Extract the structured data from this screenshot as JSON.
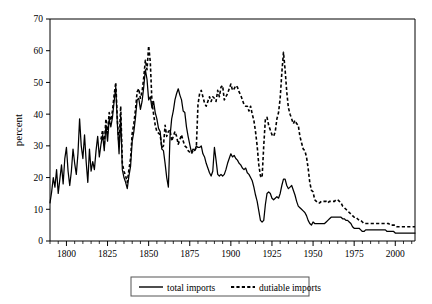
{
  "chart_data": {
    "type": "line",
    "title": "",
    "xlabel": "",
    "ylabel": "percent",
    "xlim": [
      1790,
      2012
    ],
    "ylim": [
      0,
      70
    ],
    "grid": false,
    "legend_position": "bottom-center",
    "y_ticks": [
      0,
      10,
      20,
      30,
      40,
      50,
      60,
      70
    ],
    "y_tick_labels": [
      "0",
      "10",
      "20",
      "30",
      "40",
      "50",
      "60",
      "70"
    ],
    "x_ticks": [
      1800,
      1825,
      1850,
      1875,
      1900,
      1925,
      1950,
      1975,
      2000
    ],
    "x_tick_labels": [
      "1800",
      "1825",
      "1850",
      "1875",
      "1900",
      "1925",
      "1950",
      "1975",
      "2000"
    ],
    "x_minor_tick_step": 5,
    "series": [
      {
        "name": "total imports",
        "style": "solid",
        "color": "#000000",
        "x": [
          1790,
          1791,
          1792,
          1793,
          1794,
          1795,
          1796,
          1797,
          1798,
          1799,
          1800,
          1801,
          1802,
          1803,
          1804,
          1805,
          1806,
          1807,
          1808,
          1809,
          1810,
          1811,
          1812,
          1813,
          1814,
          1815,
          1816,
          1817,
          1818,
          1819,
          1820,
          1821,
          1822,
          1823,
          1824,
          1825,
          1826,
          1827,
          1828,
          1829,
          1830,
          1831,
          1832,
          1833,
          1834,
          1835,
          1836,
          1837,
          1838,
          1839,
          1840,
          1841,
          1842,
          1843,
          1844,
          1845,
          1846,
          1847,
          1848,
          1849,
          1850,
          1851,
          1852,
          1853,
          1854,
          1855,
          1856,
          1857,
          1858,
          1859,
          1860,
          1861,
          1862,
          1863,
          1864,
          1865,
          1866,
          1867,
          1868,
          1869,
          1870,
          1871,
          1872,
          1873,
          1874,
          1875,
          1876,
          1877,
          1878,
          1879,
          1880,
          1881,
          1882,
          1883,
          1884,
          1885,
          1886,
          1887,
          1888,
          1889,
          1890,
          1891,
          1892,
          1893,
          1894,
          1895,
          1896,
          1897,
          1898,
          1899,
          1900,
          1901,
          1902,
          1903,
          1904,
          1905,
          1906,
          1907,
          1908,
          1909,
          1910,
          1911,
          1912,
          1913,
          1914,
          1915,
          1916,
          1917,
          1918,
          1919,
          1920,
          1921,
          1922,
          1923,
          1924,
          1925,
          1926,
          1927,
          1928,
          1929,
          1930,
          1931,
          1932,
          1933,
          1934,
          1935,
          1936,
          1937,
          1938,
          1939,
          1940,
          1941,
          1942,
          1943,
          1944,
          1945,
          1946,
          1947,
          1948,
          1949,
          1950,
          1951,
          1952,
          1953,
          1954,
          1955,
          1956,
          1957,
          1958,
          1959,
          1960,
          1961,
          1962,
          1963,
          1964,
          1965,
          1966,
          1967,
          1968,
          1969,
          1970,
          1971,
          1972,
          1973,
          1974,
          1975,
          1976,
          1977,
          1978,
          1979,
          1980,
          1981,
          1982,
          1983,
          1984,
          1985,
          1986,
          1987,
          1988,
          1989,
          1990,
          1991,
          1992,
          1993,
          1994,
          1995,
          1996,
          1997,
          1998,
          1999,
          2000,
          2001,
          2002,
          2003,
          2004,
          2005,
          2006,
          2007,
          2008,
          2009,
          2010,
          2011,
          2012
        ],
        "y": [
          12.0,
          15.5,
          20.0,
          17.0,
          22.5,
          15.0,
          19.5,
          24.0,
          18.0,
          26.0,
          29.5,
          22.0,
          17.5,
          22.0,
          29.0,
          24.5,
          21.0,
          27.5,
          38.5,
          30.0,
          26.0,
          33.5,
          25.0,
          18.5,
          29.0,
          22.0,
          25.0,
          22.5,
          28.5,
          33.0,
          26.5,
          30.5,
          33.5,
          28.5,
          36.5,
          31.5,
          38.5,
          36.0,
          39.0,
          44.0,
          48.5,
          36.5,
          27.5,
          39.5,
          22.5,
          20.0,
          18.5,
          16.5,
          20.5,
          23.5,
          31.5,
          34.5,
          39.0,
          44.5,
          45.0,
          41.5,
          44.0,
          48.5,
          54.0,
          51.0,
          44.5,
          45.5,
          42.0,
          44.0,
          40.5,
          38.5,
          35.5,
          34.5,
          29.0,
          28.5,
          24.5,
          20.0,
          17.0,
          33.0,
          38.5,
          41.0,
          44.5,
          46.5,
          48.0,
          46.0,
          44.5,
          41.0,
          40.5,
          36.0,
          33.0,
          30.5,
          28.0,
          29.0,
          28.5,
          30.0,
          29.5,
          29.5,
          30.0,
          27.5,
          26.5,
          24.5,
          23.0,
          21.5,
          20.5,
          22.0,
          29.5,
          25.5,
          21.0,
          20.5,
          21.0,
          20.5,
          21.0,
          22.5,
          24.5,
          26.0,
          27.5,
          26.5,
          27.0,
          26.0,
          25.5,
          24.5,
          24.0,
          23.0,
          22.5,
          23.0,
          21.5,
          21.0,
          20.0,
          19.0,
          17.0,
          14.5,
          12.5,
          9.5,
          6.5,
          6.0,
          6.5,
          11.5,
          15.0,
          15.5,
          15.0,
          13.5,
          13.0,
          13.5,
          14.0,
          13.5,
          15.0,
          17.5,
          19.5,
          19.5,
          17.5,
          16.5,
          17.0,
          17.5,
          16.0,
          14.5,
          12.5,
          11.0,
          10.5,
          10.0,
          9.5,
          9.0,
          8.0,
          6.5,
          5.5,
          5.0,
          6.0,
          5.5,
          5.5,
          5.5,
          5.5,
          5.5,
          5.5,
          5.5,
          6.0,
          6.5,
          7.0,
          7.5,
          7.5,
          7.5,
          7.5,
          7.5,
          7.5,
          7.5,
          7.0,
          7.0,
          6.5,
          6.5,
          6.0,
          5.5,
          4.5,
          4.0,
          4.0,
          4.0,
          4.0,
          3.5,
          3.0,
          3.0,
          3.5,
          3.5,
          3.5,
          3.5,
          3.5,
          3.5,
          3.5,
          3.5,
          3.5,
          3.5,
          3.5,
          3.5,
          3.5,
          3.0,
          3.0,
          3.0,
          3.0,
          3.0,
          2.5,
          2.5,
          2.5,
          2.5,
          2.5,
          2.5,
          2.5,
          2.5,
          2.5,
          2.5,
          2.5,
          2.5,
          2.5
        ]
      },
      {
        "name": "dutiable imports",
        "style": "dashed",
        "color": "#000000",
        "x": [
          1821,
          1822,
          1823,
          1824,
          1825,
          1826,
          1827,
          1828,
          1829,
          1830,
          1831,
          1832,
          1833,
          1834,
          1835,
          1836,
          1837,
          1838,
          1839,
          1840,
          1841,
          1842,
          1843,
          1844,
          1845,
          1846,
          1847,
          1848,
          1849,
          1850,
          1851,
          1852,
          1853,
          1854,
          1855,
          1856,
          1857,
          1858,
          1859,
          1860,
          1861,
          1862,
          1863,
          1864,
          1865,
          1866,
          1867,
          1868,
          1869,
          1870,
          1871,
          1872,
          1873,
          1874,
          1875,
          1876,
          1877,
          1878,
          1879,
          1880,
          1881,
          1882,
          1883,
          1884,
          1885,
          1886,
          1887,
          1888,
          1889,
          1890,
          1891,
          1892,
          1893,
          1894,
          1895,
          1896,
          1897,
          1898,
          1899,
          1900,
          1901,
          1902,
          1903,
          1904,
          1905,
          1906,
          1907,
          1908,
          1909,
          1910,
          1911,
          1912,
          1913,
          1914,
          1915,
          1916,
          1917,
          1918,
          1919,
          1920,
          1921,
          1922,
          1923,
          1924,
          1925,
          1926,
          1927,
          1928,
          1929,
          1930,
          1931,
          1932,
          1933,
          1934,
          1935,
          1936,
          1937,
          1938,
          1939,
          1940,
          1941,
          1942,
          1943,
          1944,
          1945,
          1946,
          1947,
          1948,
          1949,
          1950,
          1951,
          1952,
          1953,
          1954,
          1955,
          1956,
          1957,
          1958,
          1959,
          1960,
          1961,
          1962,
          1963,
          1964,
          1965,
          1966,
          1967,
          1968,
          1969,
          1970,
          1971,
          1972,
          1973,
          1974,
          1975,
          1976,
          1977,
          1978,
          1979,
          1980,
          1981,
          1982,
          1983,
          1984,
          1985,
          1986,
          1987,
          1988,
          1989,
          1990,
          1991,
          1992,
          1993,
          1994,
          1995,
          1996,
          1997,
          1998,
          1999,
          2000,
          2001,
          2002,
          2003,
          2004,
          2005,
          2006,
          2007,
          2008,
          2009,
          2010,
          2011,
          2012
        ],
        "y": [
          32.0,
          35.0,
          30.0,
          38.5,
          34.0,
          40.5,
          38.0,
          41.0,
          46.0,
          50.0,
          38.0,
          30.0,
          42.5,
          24.5,
          22.0,
          20.5,
          18.5,
          22.5,
          26.0,
          34.0,
          37.0,
          41.5,
          47.0,
          48.0,
          45.0,
          47.0,
          51.5,
          57.0,
          54.0,
          61.5,
          56.5,
          44.0,
          40.0,
          36.5,
          34.5,
          34.0,
          33.5,
          29.5,
          30.0,
          36.5,
          33.0,
          34.5,
          35.0,
          31.5,
          33.0,
          34.5,
          33.0,
          30.5,
          32.0,
          33.5,
          31.5,
          30.0,
          29.5,
          28.5,
          28.0,
          27.5,
          28.5,
          28.5,
          29.5,
          43.0,
          46.5,
          47.5,
          45.5,
          43.5,
          42.5,
          44.0,
          45.5,
          44.0,
          45.5,
          45.0,
          44.0,
          47.5,
          45.5,
          48.5,
          49.0,
          44.5,
          45.5,
          46.5,
          48.0,
          49.5,
          47.5,
          48.0,
          49.0,
          48.5,
          47.0,
          46.0,
          44.5,
          43.0,
          42.5,
          42.5,
          41.0,
          42.5,
          40.0,
          38.0,
          34.5,
          30.0,
          24.0,
          20.5,
          20.0,
          30.0,
          38.5,
          39.0,
          36.5,
          35.0,
          33.5,
          33.0,
          34.5,
          38.5,
          40.5,
          45.0,
          53.0,
          59.5,
          54.0,
          47.0,
          42.0,
          40.0,
          38.5,
          37.0,
          38.0,
          37.0,
          36.5,
          33.0,
          31.0,
          29.0,
          28.5,
          26.5,
          23.0,
          18.5,
          16.0,
          15.5,
          13.0,
          12.5,
          12.0,
          12.0,
          12.5,
          12.5,
          12.5,
          12.5,
          12.0,
          12.5,
          12.5,
          12.5,
          12.5,
          13.0,
          13.0,
          12.5,
          12.0,
          11.0,
          10.5,
          10.0,
          9.5,
          9.0,
          8.5,
          8.0,
          7.5,
          7.5,
          7.0,
          6.5,
          6.5,
          6.0,
          5.5,
          5.5,
          5.5,
          5.5,
          5.5,
          5.5,
          5.5,
          5.5,
          5.5,
          5.5,
          5.5,
          5.5,
          5.5,
          5.5,
          5.5,
          5.5,
          5.0,
          5.0,
          5.0,
          5.0,
          4.5,
          4.5,
          4.5,
          4.5,
          4.5,
          4.5,
          4.5,
          4.5,
          4.5,
          4.5,
          4.5,
          4.5
        ]
      }
    ]
  },
  "legend": {
    "items": [
      {
        "label": "total imports",
        "style": "solid"
      },
      {
        "label": "dutiable imports",
        "style": "dashed"
      }
    ]
  }
}
